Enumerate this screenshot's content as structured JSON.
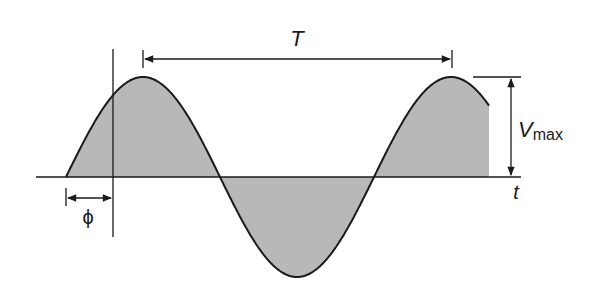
{
  "diagram": {
    "type": "sinusoidal waveform",
    "labels": {
      "period": "T",
      "amplitude_main": "V",
      "amplitude_sub": "max",
      "time_axis": "t",
      "phase": "ϕ"
    },
    "colors": {
      "stroke": "#1a1a1a",
      "fill": "#b8b8b8",
      "background": "#ffffff"
    }
  }
}
